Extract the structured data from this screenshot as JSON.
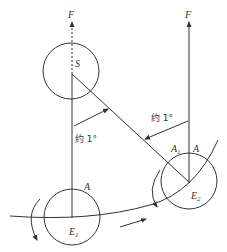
{
  "diagram": {
    "type": "sidereal-vs-solar-day",
    "labels": {
      "force_left": "F",
      "force_right": "F",
      "sun": "S",
      "earth1": "E",
      "earth1_sub": "1",
      "earth2": "E",
      "earth2_sub": "2",
      "point_a_left": "A",
      "point_a_right": "A",
      "point_a1": "A",
      "point_a1_sub": "1",
      "angle_label_left": "约 1°",
      "angle_label_right": "约 1°"
    },
    "colors": {
      "stroke": "#333333",
      "background": "#ffffff"
    }
  }
}
